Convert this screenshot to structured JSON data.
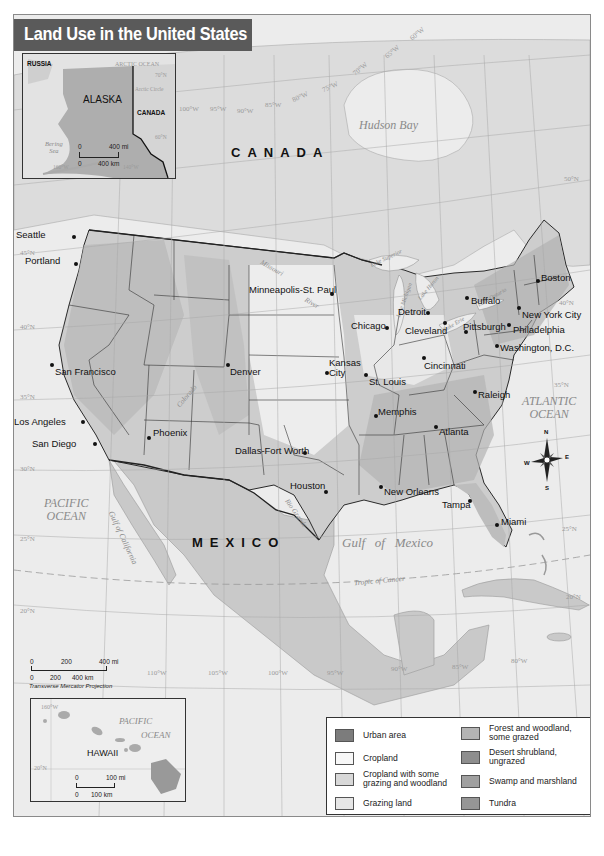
{
  "title": "Land Use in the United States",
  "countries": {
    "canada": "CANADA",
    "mexico": "MEXICO"
  },
  "water_labels": {
    "hudson_bay": "Hudson Bay",
    "pacific_ocean_line1": "PACIFIC",
    "pacific_ocean_line2": "OCEAN",
    "atlantic_ocean_line1": "ATLANTIC",
    "atlantic_ocean_line2": "OCEAN",
    "gulf_of_mexico": "Gulf   of   Mexico",
    "gulf_of_california": "Gulf of California",
    "tropic_of_cancer": "Tropic of Cancer",
    "lake_superior": "Lake Superior",
    "lake_michigan": "Lake Michigan",
    "lake_huron": "Lake Huron",
    "lake_erie": "Lake Erie",
    "lake_ontario": "Lake Ontario"
  },
  "rivers": {
    "missouri": "Missouri",
    "colorado": "Colorado",
    "rio_grande": "Rio Grande",
    "river": "River"
  },
  "cities": [
    {
      "name": "Seattle",
      "x": 73,
      "y": 236,
      "dx": -58,
      "dy": -7
    },
    {
      "name": "Portland",
      "x": 75,
      "y": 263,
      "dx": -51,
      "dy": -8
    },
    {
      "name": "San Francisco",
      "x": 51,
      "y": 364,
      "dx": 3,
      "dy": 2
    },
    {
      "name": "Los Angeles",
      "x": 82,
      "y": 421,
      "dx": -69,
      "dy": -5
    },
    {
      "name": "San Diego",
      "x": 94,
      "y": 443,
      "dx": -63,
      "dy": -5
    },
    {
      "name": "Phoenix",
      "x": 148,
      "y": 437,
      "dx": 4,
      "dy": -10
    },
    {
      "name": "Denver",
      "x": 227,
      "y": 364,
      "dx": 2,
      "dy": 2
    },
    {
      "name": "Minneapolis-St. Paul",
      "x": 331,
      "y": 293,
      "dx": -83,
      "dy": -9
    },
    {
      "name": "Dallas-Fort Worth",
      "x": 304,
      "y": 452,
      "dx": -70,
      "dy": -7
    },
    {
      "name": "Houston",
      "x": 325,
      "y": 491,
      "dx": -36,
      "dy": -11
    },
    {
      "name": "Kansas City",
      "x": 326,
      "y": 372,
      "dx": 2,
      "dy": -15,
      "multiline": "Kansas\nCity"
    },
    {
      "name": "St. Louis",
      "x": 365,
      "y": 374,
      "dx": 3,
      "dy": 2
    },
    {
      "name": "Chicago",
      "x": 386,
      "y": 327,
      "dx": -36,
      "dy": -7
    },
    {
      "name": "Memphis",
      "x": 375,
      "y": 415,
      "dx": 2,
      "dy": -9
    },
    {
      "name": "New Orleans",
      "x": 380,
      "y": 486,
      "dx": 3,
      "dy": 0
    },
    {
      "name": "Detroit",
      "x": 427,
      "y": 312,
      "dx": -30,
      "dy": -6
    },
    {
      "name": "Cleveland",
      "x": 444,
      "y": 322,
      "dx": -40,
      "dy": 3
    },
    {
      "name": "Cincinnati",
      "x": 423,
      "y": 357,
      "dx": 0,
      "dy": 3
    },
    {
      "name": "Atlanta",
      "x": 435,
      "y": 426,
      "dx": 3,
      "dy": 0
    },
    {
      "name": "Tampa",
      "x": 469,
      "y": 500,
      "dx": -28,
      "dy": -1
    },
    {
      "name": "Miami",
      "x": 496,
      "y": 524,
      "dx": 4,
      "dy": -8
    },
    {
      "name": "Raleigh",
      "x": 474,
      "y": 391,
      "dx": 3,
      "dy": -2
    },
    {
      "name": "Pittsburgh",
      "x": 465,
      "y": 331,
      "dx": -3,
      "dy": -10
    },
    {
      "name": "Buffalo",
      "x": 466,
      "y": 297,
      "dx": 4,
      "dy": -2
    },
    {
      "name": "Washington, D.C.",
      "x": 496,
      "y": 345,
      "dx": 3,
      "dy": -3
    },
    {
      "name": "Philadelphia",
      "x": 508,
      "y": 324,
      "dx": 4,
      "dy": 0
    },
    {
      "name": "New York City",
      "x": 518,
      "y": 307,
      "dx": 3,
      "dy": 2
    },
    {
      "name": "Boston",
      "x": 537,
      "y": 280,
      "dx": 3,
      "dy": -8
    }
  ],
  "graticule_labels": {
    "lon_top": [
      "110°W",
      "105°W",
      "100°W",
      "95°W",
      "90°W",
      "85°W",
      "80°W",
      "75°W",
      "70°W",
      "65°W",
      "60°W"
    ],
    "lon_bottom": [
      "110°W",
      "105°W",
      "100°W",
      "95°W",
      "90°W",
      "85°W",
      "80°W"
    ],
    "lat_left": [
      "45°N",
      "40°N",
      "35°N",
      "30°N",
      "25°N",
      "20°N"
    ],
    "lat_right": [
      "50°N",
      "40°N",
      "35°N",
      "25°N",
      "20°N"
    ]
  },
  "alaska_inset": {
    "label": "ALASKA",
    "russia": "RUSSIA",
    "canada": "CANADA",
    "arctic_ocean": "ARCTIC OCEAN",
    "arctic_circle": "Arctic Circle",
    "bering_sea_line1": "Bering",
    "bering_sea_line2": "Sea",
    "lat_70": "70°N",
    "lat_60": "60°N",
    "lon_160": "160°W",
    "lon_140": "140°W",
    "scale": {
      "zero_top": "0",
      "top": "400 mi",
      "zero_bottom": "0",
      "bottom": "400 km"
    }
  },
  "hawaii_inset": {
    "label": "HAWAII",
    "ocean_line1": "PACIFIC",
    "ocean_line2": "OCEAN",
    "lon_160": "160°W",
    "lat_20": "20°N",
    "scale": {
      "zero_top": "0",
      "top": "100 mi",
      "zero_bottom": "0",
      "bottom": "100 km"
    }
  },
  "main_scale": {
    "top_ticks": [
      "0",
      "200",
      "400 mi"
    ],
    "bottom_ticks": [
      "0",
      "200",
      "400 km"
    ],
    "projection": "Transverse Mercator Projection"
  },
  "compass": {
    "n": "N",
    "s": "S",
    "e": "E",
    "w": "W"
  },
  "legend": {
    "items": [
      {
        "label": "Urban area",
        "color": "#7c7c7c"
      },
      {
        "label": "Cropland",
        "color": "#f7f7f7"
      },
      {
        "label": "Cropland with some grazing and woodland",
        "color": "#d8d8d8"
      },
      {
        "label": "Grazing land",
        "color": "#e6e6e6"
      },
      {
        "label": "Forest and woodland, some grazed",
        "color": "#b4b4b4"
      },
      {
        "label": "Desert shrubland, ungrazed",
        "color": "#8e8e8e"
      },
      {
        "label": "Swamp and marshland",
        "color": "#a0a0a0"
      },
      {
        "label": "Tundra",
        "color": "#969696"
      }
    ]
  },
  "colors": {
    "title_bar": "#5a5a5a",
    "ocean": "#e9e9e9",
    "land_foreign": "#cfcfcf",
    "land_us": "#c9c9c9",
    "border": "#2a2a2a"
  }
}
